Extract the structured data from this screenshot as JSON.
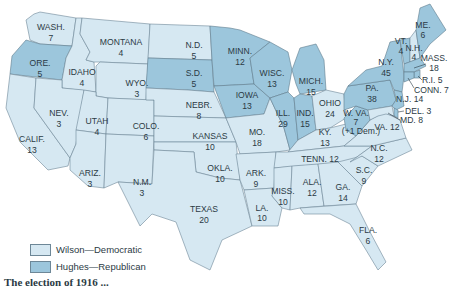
{
  "colors": {
    "democratic": "#d6e8f2",
    "republican": "#9cc6dc",
    "border": "#6d8797",
    "text": "#2b3a44"
  },
  "legend": [
    {
      "label": "Wilson—Democratic",
      "party": "democratic"
    },
    {
      "label": "Hughes—Republican",
      "party": "republican"
    }
  ],
  "caption": "The election of 1916 ...",
  "states": {
    "wash": {
      "name": "WASH.",
      "votes": "7",
      "party": "democratic"
    },
    "ore": {
      "name": "ORE.",
      "votes": "5",
      "party": "republican"
    },
    "calif": {
      "name": "CALIF.",
      "votes": "13",
      "party": "democratic"
    },
    "idaho": {
      "name": "IDAHO",
      "votes": "4",
      "party": "democratic"
    },
    "nev": {
      "name": "NEV.",
      "votes": "3",
      "party": "democratic"
    },
    "montana": {
      "name": "MONTANA",
      "votes": "4",
      "party": "democratic"
    },
    "wyo": {
      "name": "WYO.",
      "votes": "3",
      "party": "democratic"
    },
    "utah": {
      "name": "UTAH",
      "votes": "4",
      "party": "democratic"
    },
    "ariz": {
      "name": "ARIZ.",
      "votes": "3",
      "party": "democratic"
    },
    "colo": {
      "name": "COLO.",
      "votes": "6",
      "party": "democratic"
    },
    "nm": {
      "name": "N.M.",
      "votes": "3",
      "party": "democratic"
    },
    "nd": {
      "name": "N.D.",
      "votes": "5",
      "party": "democratic"
    },
    "sd": {
      "name": "S.D.",
      "votes": "5",
      "party": "republican"
    },
    "nebr": {
      "name": "NEBR.",
      "votes": "8",
      "party": "democratic"
    },
    "kansas": {
      "name": "KANSAS",
      "votes": "10",
      "party": "democratic"
    },
    "okla": {
      "name": "OKLA.",
      "votes": "10",
      "party": "democratic"
    },
    "texas": {
      "name": "TEXAS",
      "votes": "20",
      "party": "democratic"
    },
    "minn": {
      "name": "MINN.",
      "votes": "12",
      "party": "republican"
    },
    "iowa": {
      "name": "IOWA",
      "votes": "13",
      "party": "republican"
    },
    "mo": {
      "name": "MO.",
      "votes": "18",
      "party": "democratic"
    },
    "ark": {
      "name": "ARK.",
      "votes": "9",
      "party": "democratic"
    },
    "la": {
      "name": "LA.",
      "votes": "10",
      "party": "democratic"
    },
    "wisc": {
      "name": "WISC.",
      "votes": "13",
      "party": "republican"
    },
    "ill": {
      "name": "ILL.",
      "votes": "29",
      "party": "republican"
    },
    "mich": {
      "name": "MICH.",
      "votes": "15",
      "party": "republican"
    },
    "ind": {
      "name": "IND.",
      "votes": "15",
      "party": "republican"
    },
    "ohio": {
      "name": "OHIO",
      "votes": "24",
      "party": "democratic"
    },
    "ky": {
      "name": "KY.",
      "votes": "13",
      "party": "democratic"
    },
    "tenn": {
      "name": "TENN. 12",
      "votes": "12",
      "party": "democratic"
    },
    "miss": {
      "name": "MISS.",
      "votes": "10",
      "party": "democratic"
    },
    "ala": {
      "name": "ALA.",
      "votes": "12",
      "party": "democratic"
    },
    "ga": {
      "name": "GA.",
      "votes": "14",
      "party": "democratic"
    },
    "fla": {
      "name": "FLA.",
      "votes": "6",
      "party": "democratic"
    },
    "sc": {
      "name": "S.C.",
      "votes": "9",
      "party": "democratic"
    },
    "nc": {
      "name": "N.C.",
      "votes": "12",
      "party": "democratic"
    },
    "va": {
      "name": "VA. 12",
      "votes": "12",
      "party": "democratic"
    },
    "wva": {
      "name": "W. VA.",
      "votes": "7",
      "note": "(+1 Dem.)",
      "party": "republican"
    },
    "pa": {
      "name": "PA.",
      "votes": "38",
      "party": "republican"
    },
    "ny": {
      "name": "N.Y.",
      "votes": "45",
      "party": "republican"
    },
    "vt": {
      "name": "VT.",
      "votes": "4",
      "party": "republican"
    },
    "nh": {
      "name": "N.H.",
      "votes": "4",
      "party": "democratic"
    },
    "me": {
      "name": "ME.",
      "votes": "6",
      "party": "republican"
    },
    "mass": {
      "name": "MASS.",
      "votes": "18",
      "party": "republican"
    },
    "ri": {
      "name": "R.I. 5",
      "votes": "5",
      "party": "republican"
    },
    "conn": {
      "name": "CONN. 7",
      "votes": "7",
      "party": "republican"
    },
    "nj": {
      "name": "N.J. 14",
      "votes": "14",
      "party": "republican"
    },
    "del": {
      "name": "DEL. 3",
      "votes": "3",
      "party": "republican"
    },
    "md": {
      "name": "MD. 8",
      "votes": "8",
      "party": "democratic"
    }
  }
}
